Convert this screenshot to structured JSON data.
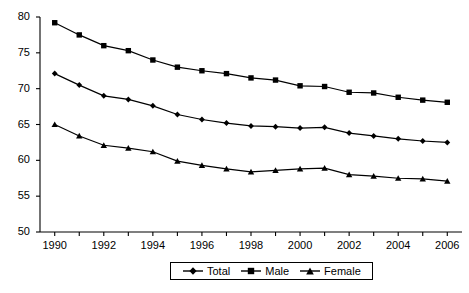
{
  "chart_data": {
    "type": "line",
    "title": "",
    "subtitle": "",
    "xlabel": "",
    "ylabel": "",
    "xlim": [
      1989.4,
      2006.6
    ],
    "ylim": [
      50,
      80
    ],
    "yticks": [
      50,
      55,
      60,
      65,
      70,
      75,
      80
    ],
    "xticks": [
      1990,
      1991,
      1992,
      1993,
      1994,
      1995,
      1996,
      1997,
      1998,
      1999,
      2000,
      2001,
      2002,
      2003,
      2004,
      2005,
      2006
    ],
    "xtick_labels": [
      "1990",
      "",
      "1992",
      "",
      "1994",
      "",
      "1996",
      "",
      "1998",
      "",
      "2000",
      "",
      "2002",
      "",
      "2004",
      "",
      "2006"
    ],
    "x": [
      1990,
      1991,
      1992,
      1993,
      1994,
      1995,
      1996,
      1997,
      1998,
      1999,
      2000,
      2001,
      2002,
      2003,
      2004,
      2005,
      2006
    ],
    "grid": false,
    "legend_position": "bottom-center",
    "series": [
      {
        "name": "Total",
        "marker": "diamond",
        "color": "#000000",
        "values": [
          72.1,
          70.5,
          69.0,
          68.5,
          67.6,
          66.4,
          65.7,
          65.2,
          64.8,
          64.7,
          64.5,
          64.6,
          63.8,
          63.4,
          63.0,
          62.7,
          62.5
        ]
      },
      {
        "name": "Male",
        "marker": "square",
        "color": "#000000",
        "values": [
          79.2,
          77.5,
          76.0,
          75.3,
          74.0,
          73.0,
          72.5,
          72.1,
          71.5,
          71.2,
          70.4,
          70.3,
          69.5,
          69.4,
          68.8,
          68.4,
          68.1
        ]
      },
      {
        "name": "Female",
        "marker": "triangle",
        "color": "#000000",
        "values": [
          65.0,
          63.4,
          62.1,
          61.7,
          61.2,
          59.9,
          59.3,
          58.8,
          58.4,
          58.6,
          58.8,
          58.9,
          58.0,
          57.8,
          57.5,
          57.4,
          57.1
        ]
      }
    ]
  },
  "legend": {
    "items": [
      {
        "label": "Total",
        "marker": "diamond"
      },
      {
        "label": "Male",
        "marker": "square"
      },
      {
        "label": "Female",
        "marker": "triangle"
      }
    ]
  },
  "axes": {
    "y_axis_name": "y-axis",
    "x_axis_name": "x-axis"
  }
}
